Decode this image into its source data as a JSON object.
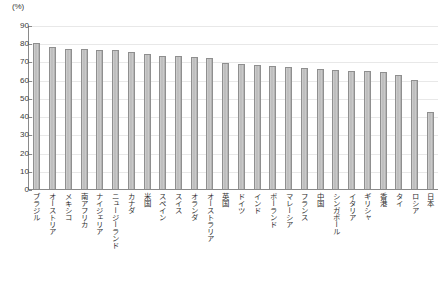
{
  "unit_label": "(%)",
  "axis": {
    "yticks": [
      "0",
      "10",
      "20",
      "30",
      "40",
      "50",
      "60",
      "70",
      "80",
      "90"
    ]
  },
  "chart_data": {
    "type": "bar",
    "title": "",
    "subtitle": "",
    "xlabel": "",
    "ylabel": "(%)",
    "ylim": [
      0,
      90
    ],
    "ytick_step": 10,
    "grid": true,
    "legend": "none",
    "categories": [
      "ブラジル",
      "オーストリア",
      "メキシコ",
      "南アフリカ",
      "ナイジェリア",
      "ニュージーランド",
      "カナダ",
      "米国",
      "スペイン",
      "スイス",
      "オランダ",
      "オーストラリア",
      "英国",
      "ドイツ",
      "インド",
      "ポーランド",
      "マレーシア",
      "フランス",
      "中国",
      "シンガポール",
      "イタリア",
      "ギリシャ",
      "香港",
      "タイ",
      "ロシア",
      "日本"
    ],
    "values": [
      80,
      78,
      77,
      77,
      76.5,
      76.5,
      75,
      74,
      73,
      73,
      72.5,
      72,
      69,
      68.5,
      68,
      67.5,
      67,
      66.5,
      66,
      65.5,
      65,
      64.5,
      64,
      62.5,
      60,
      42
    ],
    "bar_color": "#c0c0c0",
    "bar_border_color": "#8f8f8f"
  }
}
